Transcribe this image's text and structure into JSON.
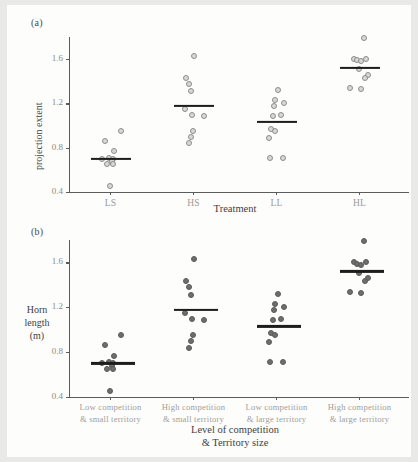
{
  "figure": {
    "panel_a_label": "(a)",
    "panel_b_label": "(b)"
  },
  "chart_data": [
    {
      "type": "scatter",
      "panel": "(a)",
      "title": "",
      "xlabel": "Treatment",
      "ylabel": "projection extent",
      "ylim": [
        0.4,
        1.8
      ],
      "yticks": [
        0.4,
        0.8,
        1.2,
        1.6
      ],
      "ytick_labels": [
        "0.4",
        "0.8",
        "1.2",
        "1.6"
      ],
      "grid": false,
      "legend": "none",
      "marker_style": "open-light-gray-circles",
      "categories": [
        "LS",
        "HS",
        "LL",
        "HL"
      ],
      "groups": [
        {
          "category": "LS",
          "mean": 0.7,
          "values": [
            0.86,
            0.95,
            0.77,
            0.71,
            0.7,
            0.7,
            0.68,
            0.65,
            0.65,
            0.45
          ]
        },
        {
          "category": "HS",
          "mean": 1.18,
          "values": [
            1.63,
            1.43,
            1.38,
            1.31,
            1.15,
            1.1,
            1.09,
            0.95,
            0.9,
            0.84
          ]
        },
        {
          "category": "LL",
          "mean": 1.03,
          "values": [
            1.32,
            1.23,
            1.18,
            1.2,
            1.1,
            1.09,
            0.97,
            0.95,
            0.89,
            0.71,
            0.71
          ]
        },
        {
          "category": "HL",
          "mean": 1.52,
          "values": [
            1.79,
            1.6,
            1.59,
            1.6,
            1.58,
            1.51,
            1.46,
            1.43,
            1.34,
            1.33
          ]
        }
      ]
    },
    {
      "type": "scatter",
      "panel": "(b)",
      "title": "",
      "xlabel": "Level of competition\n& Territory size",
      "xlabel_line1": "Level of competition",
      "xlabel_line2": "& Territory size",
      "ylabel": "Horn length (m)",
      "ylabel_line1": "Horn",
      "ylabel_line2": "length",
      "ylabel_line3": "(m)",
      "ylim": [
        0.4,
        1.8
      ],
      "yticks": [
        0.4,
        0.8,
        1.2,
        1.6
      ],
      "ytick_labels": [
        "0.4",
        "0.8",
        "1.2",
        "1.6"
      ],
      "grid": false,
      "legend": "none",
      "marker_style": "filled-dark-gray-circles",
      "categories": [
        "Low competition\n& small territory",
        "High competition\n& small territory",
        "Low competition\n& large territory",
        "High competition\n& large territory"
      ],
      "category_lines": [
        [
          "Low competition",
          "& small territory"
        ],
        [
          "High competition",
          "& small territory"
        ],
        [
          "Low competition",
          "& large territory"
        ],
        [
          "High competition",
          "& large territory"
        ]
      ],
      "groups": [
        {
          "category": "Low competition & small territory",
          "mean": 0.7,
          "values": [
            0.86,
            0.95,
            0.77,
            0.71,
            0.7,
            0.7,
            0.68,
            0.65,
            0.65,
            0.45
          ]
        },
        {
          "category": "High competition & small territory",
          "mean": 1.18,
          "values": [
            1.63,
            1.43,
            1.38,
            1.31,
            1.15,
            1.1,
            1.09,
            0.95,
            0.9,
            0.84
          ]
        },
        {
          "category": "Low competition & large territory",
          "mean": 1.03,
          "values": [
            1.32,
            1.23,
            1.18,
            1.2,
            1.1,
            1.09,
            0.97,
            0.95,
            0.89,
            0.71,
            0.71
          ]
        },
        {
          "category": "High competition & large territory",
          "mean": 1.52,
          "values": [
            1.79,
            1.6,
            1.59,
            1.6,
            1.58,
            1.51,
            1.46,
            1.43,
            1.34,
            1.33
          ]
        }
      ]
    }
  ],
  "colors": {
    "point_light_fill": "#d8d8d6",
    "point_light_stroke": "#8d8d8b",
    "point_dark_fill": "#6e6e6e",
    "mean_bar": "#1d1d1d",
    "axis": "#5c5c5c",
    "tick_text": "#8a8a88",
    "paper": "#fdfdfc",
    "page_border": "#e9e9e7"
  }
}
